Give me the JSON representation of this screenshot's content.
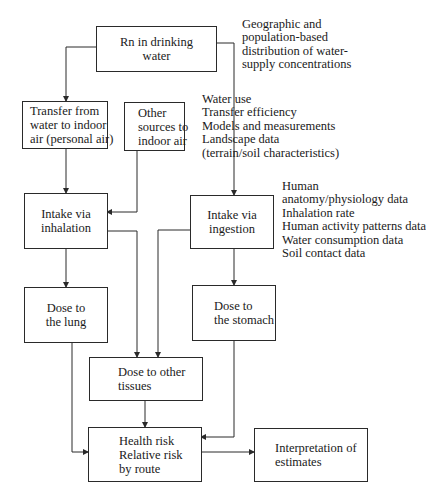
{
  "diagram": {
    "type": "flowchart",
    "boxes": {
      "rn_water": {
        "lines": [
          "Rn in drinking",
          "water"
        ]
      },
      "transfer": {
        "lines": [
          "Transfer from",
          "water to indoor",
          "air (personal air)"
        ]
      },
      "other_sources": {
        "lines": [
          "Other",
          "sources to",
          "indoor air"
        ]
      },
      "intake_inhalation": {
        "lines": [
          "Intake via",
          "inhalation"
        ]
      },
      "intake_ingestion": {
        "lines": [
          "Intake via",
          "ingestion"
        ]
      },
      "dose_lung": {
        "lines": [
          "Dose to",
          "the lung"
        ]
      },
      "dose_stomach": {
        "lines": [
          "Dose to",
          "the stomach"
        ]
      },
      "dose_other": {
        "lines": [
          "Dose to other",
          "tissues"
        ]
      },
      "health_risk": {
        "lines": [
          "Health risk",
          "Relative risk",
          "by route"
        ]
      },
      "interpretation": {
        "lines": [
          "Interpretation of",
          "estimates"
        ]
      }
    },
    "notes": {
      "distribution": {
        "lines": [
          "Geographic and",
          "population-based",
          "distribution of water-",
          "supply concentrations"
        ]
      },
      "transfer_inputs": {
        "lines": [
          "Water use",
          "Transfer efficiency",
          "Models and measurements",
          "Landscape data",
          "(terrain/soil characteristics)"
        ]
      },
      "exposure_inputs": {
        "lines": [
          "Human",
          "anatomy/physiology data",
          "Inhalation rate",
          "Human activity patterns data",
          "Water consumption data",
          "Soil contact data"
        ]
      }
    },
    "edges": [
      {
        "from": "rn_water",
        "to": "transfer"
      },
      {
        "from": "rn_water",
        "to": "intake_ingestion"
      },
      {
        "from": "transfer",
        "to": "intake_inhalation"
      },
      {
        "from": "other_sources",
        "to": "intake_inhalation"
      },
      {
        "from": "intake_inhalation",
        "to": "dose_lung"
      },
      {
        "from": "intake_inhalation",
        "to": "dose_other"
      },
      {
        "from": "intake_ingestion",
        "to": "dose_stomach"
      },
      {
        "from": "intake_ingestion",
        "to": "dose_other"
      },
      {
        "from": "dose_lung",
        "to": "health_risk"
      },
      {
        "from": "dose_other",
        "to": "health_risk"
      },
      {
        "from": "dose_stomach",
        "to": "health_risk"
      },
      {
        "from": "health_risk",
        "to": "interpretation"
      }
    ],
    "colors": {
      "line": "#2a2a2a",
      "background": "#ffffff",
      "text": "#1a1a1a"
    }
  }
}
